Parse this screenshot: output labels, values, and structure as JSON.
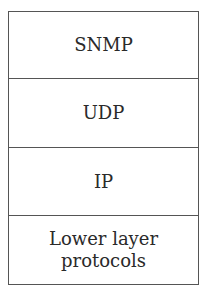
{
  "diagram": {
    "type": "protocol-stack",
    "layers": [
      {
        "label": "SNMP"
      },
      {
        "label": "UDP"
      },
      {
        "label": "IP"
      },
      {
        "label": "Lower layer\nprotocols",
        "lines": [
          "Lower layer",
          "protocols"
        ]
      }
    ],
    "colors": {
      "border": "#555555",
      "text": "#2a2a2a",
      "background": "#ffffff"
    }
  }
}
